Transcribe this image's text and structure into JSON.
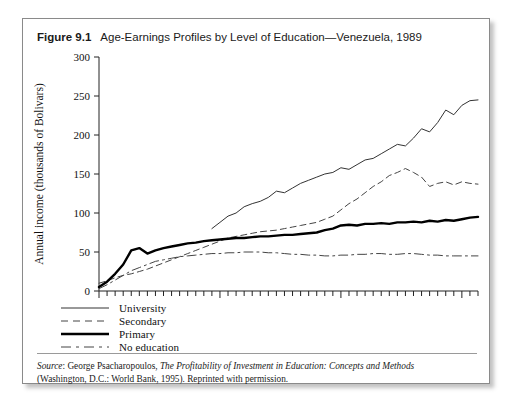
{
  "figure": {
    "number": "Figure 9.1",
    "title": "Age-Earnings Profiles by Level of Education—Venezuela, 1989"
  },
  "source": {
    "label": "Source",
    "colon": ":",
    "author": " George Psacharopoulos, ",
    "work_italic": "The Profitability of Investment in Education: Concepts and Methods",
    "line2": "(Washington, D.C.: World Bank, 1995).  Reprinted with permission."
  },
  "legend": {
    "items": [
      {
        "label": "University",
        "style": "solid-thin",
        "color": "#333333"
      },
      {
        "label": "Secondary",
        "style": "dashed-short",
        "color": "#444444"
      },
      {
        "label": "Primary",
        "style": "solid-thick",
        "color": "#000000"
      },
      {
        "label": "No education",
        "style": "dash-dot-long",
        "color": "#444444"
      }
    ]
  },
  "chart_data": {
    "type": "line",
    "title": "Age-Earnings Profiles by Level of Education—Venezuela, 1989",
    "xlabel": "Age",
    "ylabel": "Annual income (thousands of Bolivars)",
    "xlim": [
      10,
      57
    ],
    "ylim": [
      0,
      300
    ],
    "xticks": [
      10,
      25,
      40,
      55
    ],
    "xtick_labels": [
      "10",
      "25",
      "40",
      "55"
    ],
    "x_minor_tick_step": 1,
    "yticks": [
      0,
      50,
      100,
      150,
      200,
      250,
      300
    ],
    "ytick_labels": [
      "0",
      "50",
      "100",
      "150",
      "200",
      "250",
      "300"
    ],
    "grid": false,
    "legend_position": "below-left",
    "series": [
      {
        "name": "University",
        "style": "solid-thin",
        "x": [
          24,
          25,
          26,
          27,
          28,
          29,
          30,
          31,
          32,
          33,
          34,
          35,
          36,
          37,
          38,
          39,
          40,
          41,
          42,
          43,
          44,
          45,
          46,
          47,
          48,
          49,
          50,
          51,
          52,
          53,
          54,
          55,
          56,
          57
        ],
        "y": [
          80,
          88,
          96,
          100,
          108,
          112,
          115,
          120,
          128,
          126,
          132,
          138,
          142,
          146,
          150,
          152,
          158,
          156,
          162,
          168,
          170,
          176,
          182,
          188,
          186,
          196,
          208,
          204,
          216,
          232,
          226,
          238,
          244,
          245
        ]
      },
      {
        "name": "Secondary",
        "style": "dashed-short",
        "x": [
          10,
          11,
          12,
          13,
          14,
          15,
          16,
          17,
          18,
          19,
          20,
          21,
          22,
          23,
          24,
          25,
          26,
          27,
          28,
          29,
          30,
          31,
          32,
          33,
          34,
          35,
          36,
          37,
          38,
          39,
          40,
          41,
          42,
          43,
          44,
          45,
          46,
          47,
          48,
          49,
          50,
          51,
          52,
          53,
          54,
          55,
          56,
          57
        ],
        "y": [
          10,
          13,
          17,
          20,
          22,
          25,
          28,
          32,
          36,
          40,
          44,
          48,
          52,
          56,
          60,
          64,
          68,
          70,
          72,
          74,
          76,
          77,
          78,
          80,
          82,
          84,
          86,
          88,
          92,
          96,
          104,
          112,
          118,
          126,
          134,
          140,
          148,
          152,
          157,
          152,
          146,
          134,
          138,
          140,
          136,
          140,
          138,
          137
        ]
      },
      {
        "name": "Primary",
        "style": "solid-thick",
        "x": [
          10,
          11,
          12,
          13,
          14,
          15,
          16,
          17,
          18,
          19,
          20,
          21,
          22,
          23,
          24,
          25,
          26,
          27,
          28,
          29,
          30,
          31,
          32,
          33,
          34,
          35,
          36,
          37,
          38,
          39,
          40,
          41,
          42,
          43,
          44,
          45,
          46,
          47,
          48,
          49,
          50,
          51,
          52,
          53,
          54,
          55,
          56,
          57
        ],
        "y": [
          5,
          12,
          22,
          34,
          52,
          55,
          48,
          52,
          55,
          57,
          59,
          61,
          62,
          64,
          65,
          66,
          67,
          68,
          68,
          69,
          70,
          70,
          71,
          72,
          72,
          73,
          74,
          75,
          78,
          80,
          84,
          85,
          84,
          86,
          86,
          87,
          86,
          88,
          88,
          89,
          88,
          90,
          89,
          91,
          90,
          92,
          94,
          95
        ]
      },
      {
        "name": "No education",
        "style": "dash-dot-long",
        "x": [
          10,
          11,
          12,
          13,
          14,
          15,
          16,
          17,
          18,
          19,
          20,
          21,
          22,
          23,
          24,
          25,
          26,
          27,
          28,
          29,
          30,
          31,
          32,
          33,
          34,
          35,
          36,
          37,
          38,
          39,
          40,
          41,
          42,
          43,
          44,
          45,
          46,
          47,
          48,
          49,
          50,
          51,
          52,
          53,
          54,
          55,
          56,
          57
        ],
        "y": [
          3,
          8,
          14,
          20,
          26,
          30,
          34,
          38,
          40,
          42,
          44,
          45,
          46,
          47,
          48,
          48,
          49,
          49,
          50,
          50,
          50,
          49,
          49,
          48,
          47,
          47,
          46,
          46,
          45,
          45,
          46,
          46,
          47,
          47,
          48,
          48,
          47,
          47,
          48,
          48,
          47,
          46,
          46,
          45,
          45,
          45,
          45,
          45
        ]
      }
    ]
  }
}
